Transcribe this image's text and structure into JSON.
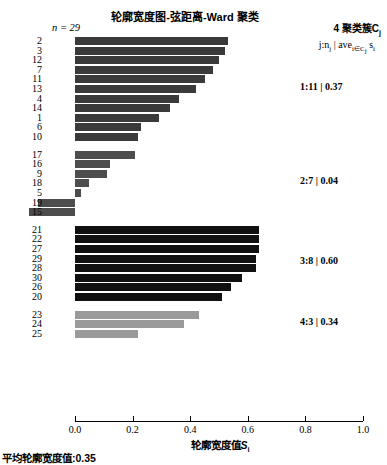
{
  "chart_data": {
    "type": "bar",
    "title": "轮廓宽度图-弦距离-Ward 聚类",
    "xlabel": "轮廓宽度值",
    "xlabel_sub": "i",
    "xlabel_var": "S",
    "ylabel": "",
    "n_label": "n = 29",
    "xlim": [
      0.0,
      1.0
    ],
    "xticks": [
      "0.0",
      "0.2",
      "0.4",
      "0.6",
      "0.8",
      "1.0"
    ],
    "xtickvalues": [
      0.0,
      0.2,
      0.4,
      0.6,
      0.8,
      1.0
    ],
    "grid": false,
    "legend_title": "4 聚类簇C",
    "legend_title_sub": "j",
    "legend_subtitle_parts": {
      "a": "j:n",
      "a_sub": "j",
      "bar": " | ",
      "b": "ave",
      "b_sub": "i∈C",
      "b_sub2": "j",
      "c": " s",
      "c_sub": "i"
    },
    "footnote": "平均轮廓宽度值:0.35",
    "mean_silhouette": 0.35,
    "clusters": [
      {
        "id": 1,
        "annotation": "1:11 | 0.37",
        "size": 11,
        "avg": 0.37,
        "color": "#3a3a3a",
        "observations": [
          {
            "label": "2",
            "value": 0.53
          },
          {
            "label": "3",
            "value": 0.52
          },
          {
            "label": "12",
            "value": 0.5
          },
          {
            "label": "7",
            "value": 0.48
          },
          {
            "label": "11",
            "value": 0.45
          },
          {
            "label": "13",
            "value": 0.42
          },
          {
            "label": "4",
            "value": 0.36
          },
          {
            "label": "14",
            "value": 0.33
          },
          {
            "label": "1",
            "value": 0.29
          },
          {
            "label": "6",
            "value": 0.23
          },
          {
            "label": "10",
            "value": 0.22
          }
        ]
      },
      {
        "id": 2,
        "annotation": "2:7 | 0.04",
        "size": 7,
        "avg": 0.04,
        "color": "#4d4d4d",
        "observations": [
          {
            "label": "17",
            "value": 0.21
          },
          {
            "label": "16",
            "value": 0.12
          },
          {
            "label": "9",
            "value": 0.11
          },
          {
            "label": "18",
            "value": 0.05
          },
          {
            "label": "5",
            "value": 0.02
          },
          {
            "label": "19",
            "value": -0.13
          },
          {
            "label": "15",
            "value": -0.16
          }
        ]
      },
      {
        "id": 3,
        "annotation": "3:8 | 0.60",
        "size": 8,
        "avg": 0.6,
        "color": "#111111",
        "observations": [
          {
            "label": "21",
            "value": 0.64
          },
          {
            "label": "22",
            "value": 0.64
          },
          {
            "label": "27",
            "value": 0.64
          },
          {
            "label": "29",
            "value": 0.63
          },
          {
            "label": "28",
            "value": 0.63
          },
          {
            "label": "30",
            "value": 0.58
          },
          {
            "label": "26",
            "value": 0.54
          },
          {
            "label": "20",
            "value": 0.51
          }
        ]
      },
      {
        "id": 4,
        "annotation": "4:3 | 0.34",
        "size": 3,
        "avg": 0.34,
        "color": "#9a9a9a",
        "observations": [
          {
            "label": "23",
            "value": 0.43
          },
          {
            "label": "24",
            "value": 0.38
          },
          {
            "label": "25",
            "value": 0.22
          }
        ]
      }
    ]
  }
}
